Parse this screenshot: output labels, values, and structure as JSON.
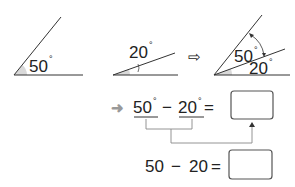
{
  "angles": {
    "first": {
      "value": "50",
      "unit": "°"
    },
    "second": {
      "value": "20",
      "unit": "°"
    },
    "combined_large": {
      "value": "50",
      "unit": "°"
    },
    "combined_small": {
      "value": "20",
      "unit": "°"
    }
  },
  "arrow_symbol": "⇨",
  "equation1": {
    "lead_arrow": "➜",
    "a": "50",
    "a_unit": "°",
    "minus": "−",
    "b": "20",
    "b_unit": "°",
    "equals": "="
  },
  "equation2": {
    "a": "50",
    "minus": "−",
    "b": "20",
    "equals": "="
  },
  "colors": {
    "line": "#333333",
    "shade": "#d9d9d9",
    "bracket": "#888888",
    "lead_arrow": "#999999"
  }
}
